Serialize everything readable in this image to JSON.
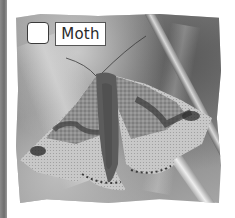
{
  "figure": {
    "subject": "Moth",
    "style": "black-and-white photo with torn/deckled edges on white page"
  },
  "answer_option": {
    "checkbox_checked": false,
    "label": "Moth"
  },
  "colors": {
    "background": "#ffffff",
    "page_strip": "#7a7a7a",
    "label_border": "#555555",
    "label_text": "#2a2a2a"
  }
}
